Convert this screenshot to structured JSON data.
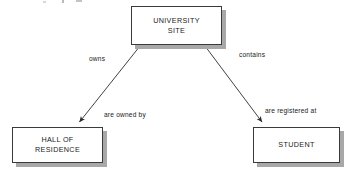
{
  "diagram": {
    "type": "entity-relationship-diagram",
    "background_color": "#ffffff",
    "node_fill_color": "#ffffff",
    "node_border_color": "#3a3a3a",
    "node_shadow_color": "#a8a8a8",
    "line_color": "#2b2b2b",
    "nodes": [
      {
        "id": "university-site",
        "label": "UNIVERSITY\nSITE",
        "x": 131,
        "y": 6,
        "width": 91,
        "height": 39
      },
      {
        "id": "hall-of-residence",
        "label": "HALL OF\nRESIDENCE",
        "x": 12,
        "y": 127,
        "width": 91,
        "height": 36
      },
      {
        "id": "student",
        "label": "STUDENT",
        "x": 253,
        "y": 127,
        "width": 87,
        "height": 36
      }
    ],
    "edges": [
      {
        "id": "university-site-to-hall-of-residence",
        "from": "university-site",
        "to": "hall-of-residence",
        "forward_label": "owns",
        "reverse_label": "are owned by",
        "x1": 140,
        "y1": 46,
        "x2": 78,
        "y2": 124,
        "arrow_at": "hall-of-residence"
      },
      {
        "id": "university-site-to-student",
        "from": "university-site",
        "to": "student",
        "forward_label": "contains",
        "reverse_label": "are registered at",
        "x1": 205,
        "y1": 46,
        "x2": 263,
        "y2": 124,
        "arrow_at": "student"
      }
    ]
  }
}
